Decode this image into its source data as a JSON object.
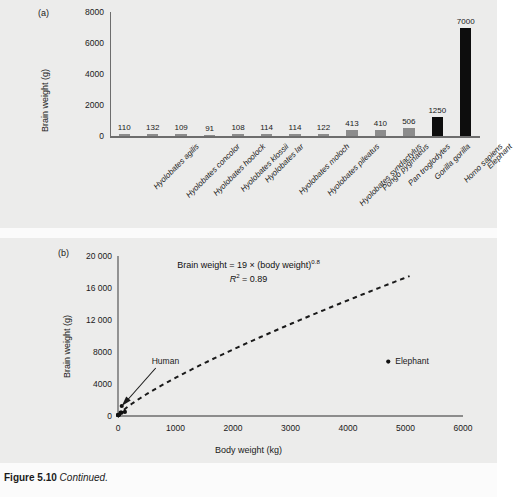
{
  "caption": {
    "figure_number": "Figure 5.10",
    "text": "Continued."
  },
  "panel_a": {
    "tag": "(a)",
    "ylabel": "Brain weight (g)",
    "yticks": [
      "0",
      "2000",
      "4000",
      "6000",
      "8000"
    ]
  },
  "panel_b": {
    "tag": "(b)",
    "ylabel": "Brain weight (g)",
    "xlabel": "Body weight (kg)",
    "yticks": [
      "0",
      "4000",
      "8000",
      "12 000",
      "16 000",
      "20 000"
    ],
    "xticks": [
      "0",
      "1000",
      "2000",
      "3000",
      "4000",
      "5000",
      "6000"
    ],
    "equation_line1_prefix": "Brain weight = 19 × (body weight)",
    "equation_line1_exponent": "0.8",
    "equation_line2_r": "R",
    "equation_line2_rest": " = 0.89",
    "equation_line2_exponent": "2",
    "annotation_human": "Human",
    "annotation_elephant": "Elephant"
  },
  "chart_data": [
    {
      "type": "bar",
      "title": "(a)",
      "xlabel": "",
      "ylabel": "Brain weight (g)",
      "ylim": [
        0,
        8000
      ],
      "grid": false,
      "legend": "none",
      "categories": [
        "Hyolobates agilis",
        "Hyolobates concolor",
        "Hyolobates hoolock",
        "Hyolobates klossii",
        "Hyolobates lar",
        "Hyolobates moloch",
        "Hyolobates pileatus",
        "Hyolobates syndactylus",
        "Pongo pygmaeus",
        "Pan troglodytes",
        "Gorilla gorilla",
        "Homo sapiens",
        "Elephant"
      ],
      "values": [
        110,
        132,
        109,
        91,
        108,
        114,
        114,
        122,
        413,
        410,
        506,
        1250,
        7000
      ],
      "value_labels": [
        "110",
        "132",
        "109",
        "91",
        "108",
        "114",
        "114",
        "122",
        "413",
        "410",
        "506",
        "1250",
        "7000"
      ],
      "bar_colors": [
        "#8c8c8c",
        "#8c8c8c",
        "#8c8c8c",
        "#8c8c8c",
        "#8c8c8c",
        "#8c8c8c",
        "#8c8c8c",
        "#8c8c8c",
        "#8c8c8c",
        "#8c8c8c",
        "#8c8c8c",
        "#0d0d0d",
        "#0d0d0d"
      ]
    },
    {
      "type": "scatter",
      "title": "(b)",
      "xlabel": "Body weight (kg)",
      "ylabel": "Brain weight (g)",
      "xlim": [
        0,
        6000
      ],
      "ylim": [
        0,
        20000
      ],
      "grid": false,
      "legend": "none",
      "annotations": [
        "Brain weight = 19 × (body weight)0.8",
        "R2 = 0.89",
        "Human",
        "Elephant"
      ],
      "points": [
        {
          "label": "Hyolobates agilis",
          "x": 6,
          "y": 110
        },
        {
          "label": "Hyolobates concolor",
          "x": 7,
          "y": 132
        },
        {
          "label": "Hyolobates hoolock",
          "x": 7,
          "y": 109
        },
        {
          "label": "Hyolobates klossii",
          "x": 6,
          "y": 91
        },
        {
          "label": "Hyolobates lar",
          "x": 6,
          "y": 108
        },
        {
          "label": "Hyolobates moloch",
          "x": 6,
          "y": 114
        },
        {
          "label": "Hyolobates pileatus",
          "x": 6,
          "y": 114
        },
        {
          "label": "Hyolobates syndactylus",
          "x": 11,
          "y": 122
        },
        {
          "label": "Pongo pygmaeus",
          "x": 60,
          "y": 413
        },
        {
          "label": "Pan troglodytes",
          "x": 45,
          "y": 410
        },
        {
          "label": "Gorilla gorilla",
          "x": 120,
          "y": 506
        },
        {
          "label": "Human",
          "x": 65,
          "y": 1250
        },
        {
          "label": "Elephant",
          "x": 4700,
          "y": 6800
        }
      ],
      "fit_curve": {
        "style": "dashed",
        "formula": "y = 19 * x^0.8",
        "coefficient": 19,
        "exponent": 0.8,
        "r_squared": 0.89,
        "x_range": [
          0,
          5100
        ]
      }
    }
  ]
}
